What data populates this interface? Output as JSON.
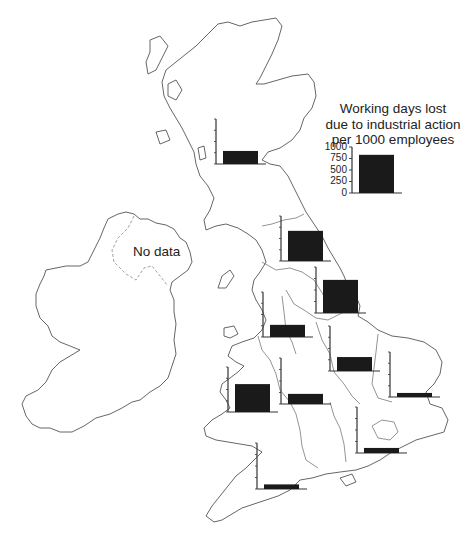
{
  "legend": {
    "title_lines": [
      "Working days lost",
      "due to industrial action",
      "per 1000 employees"
    ],
    "ticks": [
      "1000",
      "750",
      "500",
      "250",
      "0"
    ],
    "value": 830
  },
  "labels": {
    "no_data": "No data"
  },
  "colors": {
    "bar": "#1a1a1a",
    "axis": "#333333",
    "coast": "#555555"
  },
  "chart_data": {
    "type": "bar",
    "title": "Working days lost due to industrial action per 1000 employees",
    "xlabel": "",
    "ylabel": "Working days lost per 1000 employees",
    "ylim": [
      0,
      1000
    ],
    "yticks": [
      0,
      250,
      500,
      750,
      1000
    ],
    "grid": false,
    "legend_position": "top-right",
    "categories": [
      "United Kingdom (key)",
      "Scotland",
      "North",
      "Yorkshire and Humberside",
      "North West",
      "East Midlands",
      "East Anglia",
      "Wales",
      "West Midlands",
      "South East",
      "South West",
      "Northern Ireland"
    ],
    "values": [
      830,
      290,
      670,
      720,
      270,
      310,
      90,
      620,
      220,
      110,
      100,
      null
    ],
    "annotations": [
      "Northern Ireland: No data"
    ]
  },
  "mini_charts": [
    {
      "name": "scotland",
      "x": 216,
      "y0": 164,
      "h": 45,
      "value": 290
    },
    {
      "name": "north",
      "x": 281,
      "y0": 261,
      "h": 45,
      "value": 670
    },
    {
      "name": "yorkshire",
      "x": 316,
      "y0": 313,
      "h": 46,
      "value": 720
    },
    {
      "name": "north-west",
      "x": 263,
      "y0": 337,
      "h": 45,
      "value": 270
    },
    {
      "name": "east-midlands",
      "x": 330,
      "y0": 371,
      "h": 45,
      "value": 310
    },
    {
      "name": "east-anglia",
      "x": 390,
      "y0": 397,
      "h": 45,
      "value": 90
    },
    {
      "name": "wales",
      "x": 228,
      "y0": 412,
      "h": 45,
      "value": 620
    },
    {
      "name": "west-midlands",
      "x": 281,
      "y0": 404,
      "h": 46,
      "value": 220
    },
    {
      "name": "south-east",
      "x": 357,
      "y0": 453,
      "h": 46,
      "value": 110
    },
    {
      "name": "south-west",
      "x": 257,
      "y0": 489,
      "h": 46,
      "value": 100
    }
  ]
}
